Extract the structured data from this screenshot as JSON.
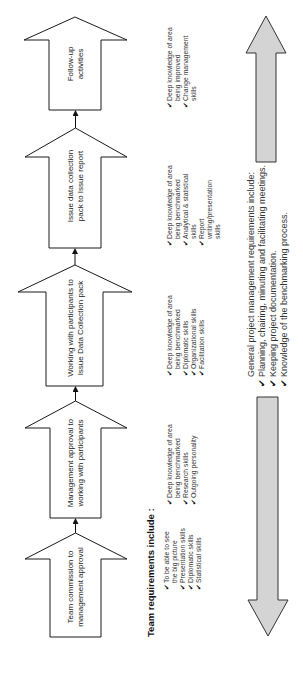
{
  "diagram": {
    "orientation": "rotated 90 degrees counter-clockwise",
    "steps": [
      {
        "label_line1": "Team commission to",
        "label_line2": "management approval"
      },
      {
        "label_line1": "Management approval to",
        "label_line2": "working with participants"
      },
      {
        "label_line1": "Working with participants to",
        "label_line2": "Issue Data Collection pack"
      },
      {
        "label_line1": "Issue data collection",
        "label_line2": "pack to Issue report"
      },
      {
        "label_line1": "Follow-up",
        "label_line2": "activities"
      }
    ],
    "team_requirements": {
      "title": "Team requirements include :",
      "columns": [
        {
          "items": [
            "To be able to see the big picture",
            "Presentation skills",
            "Diplomatic skills",
            "Statistical skills"
          ]
        },
        {
          "items": [
            "Deep knowledge of area being benchmarked",
            "Research skills",
            "Outgoing personality"
          ]
        },
        {
          "items": [
            "Deep knowledge of area being benchmarked",
            "Diplomatic skills",
            "Organizational skills",
            "Facilitation skills"
          ]
        },
        {
          "items": [
            "Deep knowledge of area being benchmarked",
            "Analytical & statistical skills",
            "Report writing/presentation skills"
          ]
        },
        {
          "items": [
            "Deep knowledge of area being improved",
            "Change management skills"
          ]
        }
      ]
    },
    "general_requirements": {
      "title": "General project management requirements include:",
      "items": [
        "Planning, chairing, minuting and facilitating meetings.",
        "Keeping project documentation.",
        "Knowledge of the benchmarking process."
      ]
    },
    "check_glyph": "✔",
    "colors": {
      "outline": "#1a1a1a",
      "arrow_fill": "#ffffff",
      "span_arrow_fill": "#d4d4d4",
      "span_arrow_stroke": "#333333"
    }
  }
}
